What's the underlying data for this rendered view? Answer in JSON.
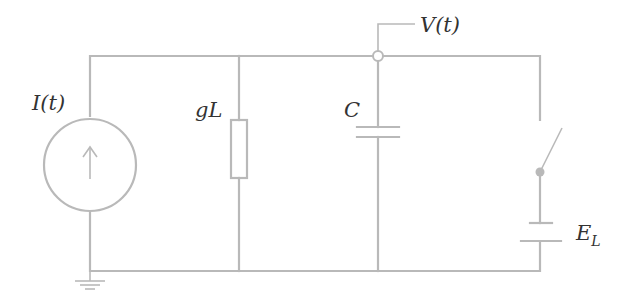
{
  "diagram": {
    "type": "circuit-schematic",
    "wire_color": "#b9b9b9",
    "label_color": "#333333",
    "labels": {
      "current_source": "I(t)",
      "conductance": "gL",
      "capacitor": "C",
      "voltage": "V(t)",
      "battery_main": "E",
      "battery_sub": "L"
    },
    "components": [
      {
        "id": "current-source",
        "kind": "current-source",
        "label": "I(t)",
        "direction": "up"
      },
      {
        "id": "resistor",
        "kind": "resistor",
        "label": "gL"
      },
      {
        "id": "capacitor",
        "kind": "capacitor",
        "label": "C"
      },
      {
        "id": "switch",
        "kind": "switch",
        "state": "open"
      },
      {
        "id": "battery",
        "kind": "battery",
        "label": "E_L"
      },
      {
        "id": "ground",
        "kind": "ground"
      },
      {
        "id": "voltage-node",
        "kind": "probe-node",
        "label": "V(t)"
      }
    ]
  }
}
